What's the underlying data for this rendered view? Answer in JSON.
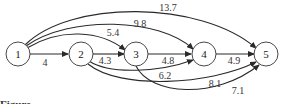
{
  "diagram": {
    "type": "directed-weighted-graph",
    "nodes": [
      {
        "id": "1",
        "label": "1"
      },
      {
        "id": "2",
        "label": "2"
      },
      {
        "id": "3",
        "label": "3"
      },
      {
        "id": "4",
        "label": "4"
      },
      {
        "id": "5",
        "label": "5"
      }
    ],
    "edges": [
      {
        "from": "1",
        "to": "2",
        "weight": "4"
      },
      {
        "from": "1",
        "to": "3",
        "weight": "5.4"
      },
      {
        "from": "1",
        "to": "4",
        "weight": "9.8"
      },
      {
        "from": "1",
        "to": "5",
        "weight": "13.7"
      },
      {
        "from": "2",
        "to": "3",
        "weight": "4.3"
      },
      {
        "from": "2",
        "to": "4",
        "weight": "6.2"
      },
      {
        "from": "2",
        "to": "5",
        "weight": "8.1"
      },
      {
        "from": "3",
        "to": "4",
        "weight": "4.8"
      },
      {
        "from": "3",
        "to": "5",
        "weight": "7.1"
      },
      {
        "from": "4",
        "to": "5",
        "weight": "4.9"
      }
    ]
  },
  "caption": "Figure"
}
